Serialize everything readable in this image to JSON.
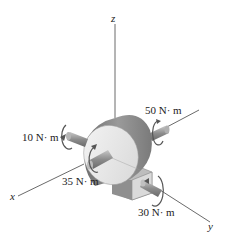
{
  "diagram": {
    "type": "3D statics free-body sketch: gearbox with couple moments",
    "axes": {
      "z": {
        "label": "z"
      },
      "x": {
        "label": "x"
      },
      "y": {
        "label": "y"
      }
    },
    "moments": [
      {
        "id": "m10",
        "label": "10 N· m",
        "axis": "x-shaft (rear)"
      },
      {
        "id": "m35",
        "label": "35 N· m",
        "axis": "x-shaft (front)"
      },
      {
        "id": "m50",
        "label": "50 N· m",
        "axis": "y-shaft (rear)"
      },
      {
        "id": "m30",
        "label": "30 N· m",
        "axis": "y-shaft (front)"
      }
    ],
    "colors": {
      "drum_face": "#e6e6e6",
      "drum_side": "#8a8a8a",
      "shaft": "#9a9a9a",
      "base": "#c9c9c9",
      "line": "#333333"
    }
  }
}
